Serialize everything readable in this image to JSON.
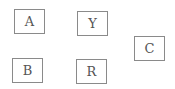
{
  "diagram": {
    "nodes": [
      {
        "id": "A",
        "label": "A",
        "x": 14,
        "y": 9,
        "w": 31,
        "h": 25
      },
      {
        "id": "Y",
        "label": "Y",
        "x": 77,
        "y": 11,
        "w": 31,
        "h": 25
      },
      {
        "id": "C",
        "label": "C",
        "x": 134,
        "y": 36,
        "w": 31,
        "h": 25
      },
      {
        "id": "B",
        "label": "B",
        "x": 12,
        "y": 58,
        "w": 31,
        "h": 25
      },
      {
        "id": "R",
        "label": "R",
        "x": 76,
        "y": 59,
        "w": 31,
        "h": 25
      }
    ],
    "colors": {
      "border": "#8a8a8a",
      "text": "#555555",
      "background": "#ffffff"
    }
  }
}
